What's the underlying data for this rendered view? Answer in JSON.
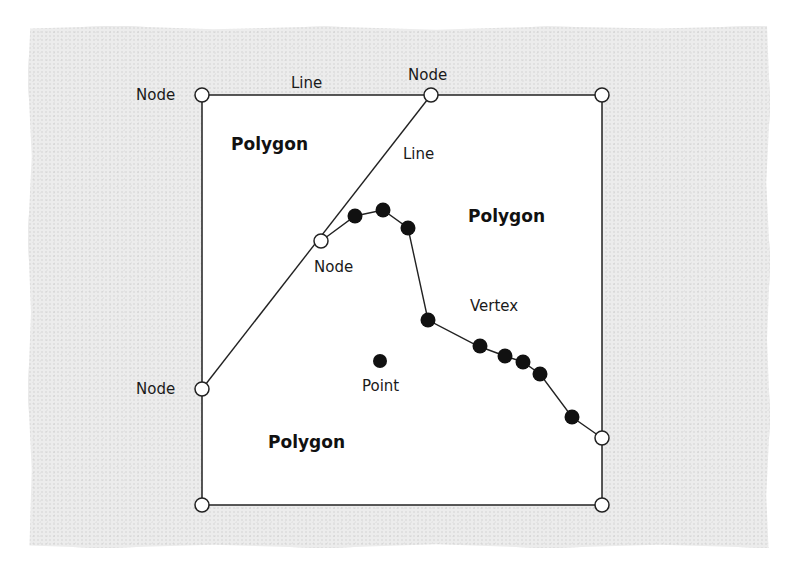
{
  "figure": {
    "colors": {
      "paper": "#ececec",
      "box_fill": "#ffffff",
      "stroke": "#222222",
      "vertex_fill": "#111111",
      "node_fill": "#ffffff"
    },
    "labels": {
      "node_top_left": "Node",
      "node_top_middle": "Node",
      "node_middle": "Node",
      "node_left": "Node",
      "line_top": "Line",
      "line_diagonal": "Line",
      "vertex": "Vertex",
      "point": "Point",
      "polygon_top_left": "Polygon",
      "polygon_right": "Polygon",
      "polygon_bottom": "Polygon"
    },
    "legend_terms": [
      "Node",
      "Line",
      "Vertex",
      "Point",
      "Polygon"
    ],
    "counts": {
      "nodes": 8,
      "vertices": 10,
      "points": 1,
      "polygons": 3,
      "labeled_lines": 2
    }
  }
}
